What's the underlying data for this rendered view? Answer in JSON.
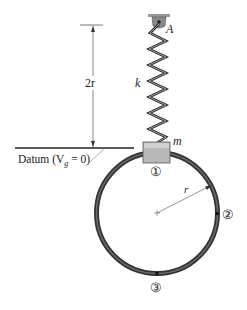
{
  "diagram": {
    "labels": {
      "support_point": "A",
      "spring_constant": "k",
      "mass": "m",
      "height_dimension": "2r",
      "radius": "r",
      "datum_text": "Datum (V",
      "datum_sub": "g",
      "datum_tail": " = 0)",
      "position_1": "①",
      "position_2": "②",
      "position_3": "③"
    },
    "colors": {
      "ring": "#3a3a3a",
      "ring_inner": "#6a6a6a",
      "block_fill": "#b5b5b5",
      "block_stroke": "#555555",
      "spring": "#2a2a2a",
      "support": "#8a8a8a",
      "lines": "#333333"
    }
  }
}
